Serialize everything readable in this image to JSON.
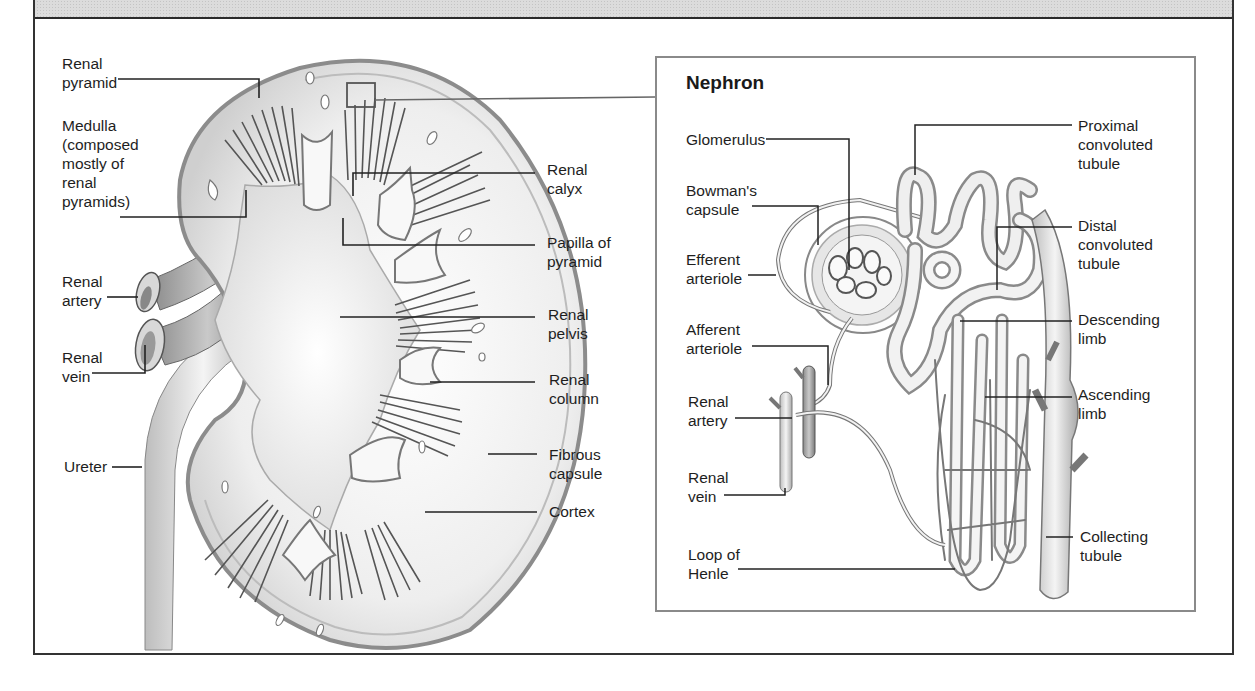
{
  "header": {
    "title_visible_fragment": ""
  },
  "colors": {
    "frame": "#333333",
    "header_band": "#dcdcdc",
    "nephron_box_border": "#8a8a8a",
    "leader_line": "#222222",
    "illustration_fill": "#ececec",
    "illustration_shade": "#9a9a9a"
  },
  "kidney": {
    "labels": {
      "renal_pyramid": "Renal\npyramid",
      "medulla": "Medulla\n(composed\nmostly of\nrenal\npyramids)",
      "renal_artery": "Renal\nartery",
      "renal_vein": "Renal\nvein",
      "ureter": "Ureter",
      "renal_calyx": "Renal\ncalyx",
      "papilla_of_pyramid": "Papilla of\npyramid",
      "renal_pelvis": "Renal\npelvis",
      "renal_column": "Renal\ncolumn",
      "fibrous_capsule": "Fibrous\ncapsule",
      "cortex": "Cortex"
    }
  },
  "nephron": {
    "title": "Nephron",
    "labels": {
      "glomerulus": "Glomerulus",
      "bowmans_capsule": "Bowman's\ncapsule",
      "efferent_arteriole": "Efferent\narteriole",
      "afferent_arteriole": "Afferent\narteriole",
      "renal_artery": "Renal\nartery",
      "renal_vein": "Renal\nvein",
      "loop_of_henle": "Loop of\nHenle",
      "proximal_convoluted_tubule": "Proximal\nconvoluted\ntubule",
      "distal_convoluted_tubule": "Distal\nconvoluted\ntubule",
      "descending_limb": "Descending\nlimb",
      "ascending_limb": "Ascending\nlimb",
      "collecting_tubule": "Collecting\ntubule"
    }
  }
}
